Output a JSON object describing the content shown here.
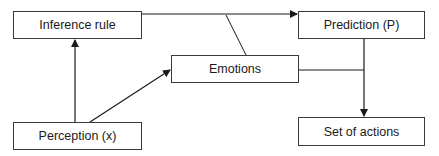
{
  "diagram": {
    "nodes": [
      {
        "id": "inference",
        "label": "Inference rule"
      },
      {
        "id": "prediction",
        "label": "Prediction (P)"
      },
      {
        "id": "emotions",
        "label": "Emotions"
      },
      {
        "id": "perception",
        "label": "Perception (x)"
      },
      {
        "id": "actions",
        "label": "Set of actions"
      }
    ],
    "edges": [
      {
        "from": "inference",
        "to": "prediction",
        "arrow": true
      },
      {
        "from": "perception",
        "to": "inference",
        "arrow": true
      },
      {
        "from": "perception",
        "to": "emotions",
        "arrow": true
      },
      {
        "from": "emotions",
        "to": "inference-prediction-edge",
        "arrow": false
      },
      {
        "from": "emotions",
        "to": "prediction-actions-edge",
        "arrow": false
      },
      {
        "from": "prediction",
        "to": "actions",
        "arrow": true
      }
    ],
    "colors": {
      "line": "#1a1a1a",
      "border": "#3a3a3a",
      "background": "#ffffff"
    }
  }
}
